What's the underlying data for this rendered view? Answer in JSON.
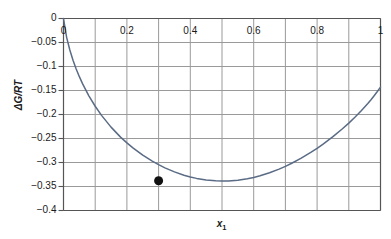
{
  "chart_data": {
    "type": "line",
    "title": "",
    "xlabel": "x₁",
    "xlabel_text": "x",
    "xlabel_sub": "1",
    "ylabel": "ΔG/RT",
    "xlim": [
      0,
      1
    ],
    "ylim": [
      -0.4,
      0
    ],
    "grid": true,
    "legend": null,
    "x_ticks": [
      {
        "value": 0,
        "label": "0"
      },
      {
        "value": 0.2,
        "label": "0.2"
      },
      {
        "value": 0.4,
        "label": "0.4"
      },
      {
        "value": 0.6,
        "label": "0.6"
      },
      {
        "value": 0.8,
        "label": "0.8"
      },
      {
        "value": 1,
        "label": "1"
      }
    ],
    "x_gridline_values": [
      0,
      0.1,
      0.2,
      0.3,
      0.4,
      0.5,
      0.6,
      0.7,
      0.8,
      0.9,
      1
    ],
    "y_ticks": [
      {
        "value": 0,
        "label": "0"
      },
      {
        "value": -0.05,
        "label": "−0.05"
      },
      {
        "value": -0.1,
        "label": "−0.1"
      },
      {
        "value": -0.15,
        "label": "−0.15"
      },
      {
        "value": -0.2,
        "label": "−0.2"
      },
      {
        "value": -0.25,
        "label": "−0.25"
      },
      {
        "value": -0.3,
        "label": "−0.3"
      },
      {
        "value": -0.35,
        "label": "−0.35"
      },
      {
        "value": -0.4,
        "label": "−0.4"
      }
    ],
    "series": [
      {
        "name": "Gibbs energy of mixing",
        "color": "#5a6b85",
        "x": [
          0,
          0.01,
          0.02,
          0.03,
          0.04,
          0.05,
          0.06,
          0.08,
          0.1,
          0.12,
          0.15,
          0.18,
          0.2,
          0.22,
          0.25,
          0.28,
          0.3,
          0.32,
          0.35,
          0.38,
          0.4,
          0.42,
          0.45,
          0.48,
          0.5,
          0.52,
          0.55,
          0.58,
          0.6,
          0.62,
          0.65,
          0.68,
          0.7,
          0.72,
          0.75,
          0.78,
          0.8,
          0.82,
          0.85,
          0.88,
          0.9,
          0.92,
          0.94,
          0.95,
          0.96,
          0.97,
          0.98,
          0.99,
          1.0
        ],
        "y": [
          0,
          -0.0398,
          -0.0657,
          -0.0869,
          -0.1051,
          -0.1212,
          -0.1357,
          -0.1611,
          -0.1828,
          -0.2018,
          -0.2263,
          -0.2471,
          -0.2592,
          -0.2702,
          -0.2848,
          -0.2972,
          -0.3045,
          -0.3111,
          -0.3196,
          -0.3264,
          -0.3301,
          -0.3331,
          -0.3363,
          -0.3381,
          -0.3386,
          -0.3385,
          -0.3369,
          -0.3339,
          -0.3311,
          -0.3277,
          -0.3214,
          -0.3138,
          -0.308,
          -0.3016,
          -0.291,
          -0.2791,
          -0.2704,
          -0.2611,
          -0.2461,
          -0.2297,
          -0.2179,
          -0.2053,
          -0.1917,
          -0.1845,
          -0.177,
          -0.1691,
          -0.1608,
          -0.1521,
          -0.143
        ]
      }
    ],
    "markers": [
      {
        "name": "minimum-point",
        "x": 0.3,
        "y": -0.338,
        "color": "#111111",
        "radius": 4.5
      }
    ],
    "colors": {
      "curve": "#5a6b85",
      "grid": "#9a9a9a",
      "axis": "#555555",
      "marker": "#111111",
      "background": "#ffffff",
      "text": "#1a1a1a"
    }
  }
}
